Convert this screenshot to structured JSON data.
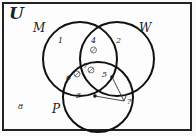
{
  "diagram": {
    "type": "venn",
    "universal_set": "U",
    "sets": [
      {
        "name": "M"
      },
      {
        "name": "W"
      },
      {
        "name": "P"
      }
    ],
    "regions": [
      {
        "id": "1",
        "description": "M only"
      },
      {
        "id": "2",
        "description": "W only"
      },
      {
        "id": "3",
        "description": "P only"
      },
      {
        "id": "4",
        "description": "M and W only",
        "has_symbol": true
      },
      {
        "id": "5",
        "description": "W and P only",
        "has_dot": true
      },
      {
        "id": "6",
        "description": "M and P only",
        "has_symbol": true
      },
      {
        "id": "7",
        "description": "M, W and P",
        "has_symbol": true
      },
      {
        "id": "8",
        "description": "outside all sets"
      }
    ],
    "query_label": "?",
    "query_points": [
      "region 5",
      "region 3"
    ]
  },
  "labels": {
    "universe": "U",
    "set_m": "M",
    "set_w": "W",
    "set_p": "P",
    "r1": "1",
    "r2": "2",
    "r3": "3",
    "r4": "4",
    "r5": "5",
    "r6": "6",
    "r7": "7",
    "r8": "8",
    "question": "?"
  }
}
